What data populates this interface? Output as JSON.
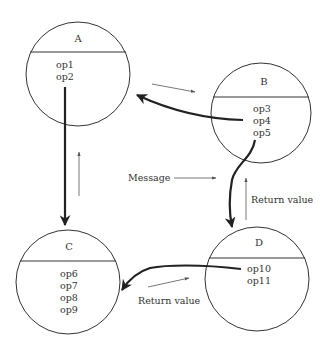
{
  "diagram": {
    "type": "object-message-diagram",
    "colors": {
      "outline": "#333333",
      "thick_arrow": "#222222",
      "thin_arrow": "#555555",
      "background": "#ffffff"
    },
    "objects": [
      {
        "id": "A",
        "name": "A",
        "operations": [
          "op1",
          "op2"
        ]
      },
      {
        "id": "B",
        "name": "B",
        "operations": [
          "op3",
          "op4",
          "op5"
        ]
      },
      {
        "id": "C",
        "name": "C",
        "operations": [
          "op6",
          "op7",
          "op8",
          "op9"
        ]
      },
      {
        "id": "D",
        "name": "D",
        "operations": [
          "op10",
          "op11"
        ]
      }
    ],
    "edges": [
      {
        "from": "A.op2",
        "to": "C",
        "kind": "call"
      },
      {
        "from": "C",
        "to": "A",
        "kind": "return"
      },
      {
        "from": "B.op4",
        "to": "A",
        "kind": "call"
      },
      {
        "from": "A",
        "to": "B",
        "kind": "return"
      },
      {
        "from": "B.op5",
        "to": "D",
        "kind": "call"
      },
      {
        "from": "D",
        "to": "B",
        "kind": "return",
        "label": "Return value"
      },
      {
        "from": "D.op10",
        "to": "C",
        "kind": "call"
      },
      {
        "from": "C",
        "to": "D",
        "kind": "return",
        "label": "Return value"
      }
    ],
    "labels": {
      "message": "Message",
      "return_value_right": "Return value",
      "return_value_bottom": "Return value"
    }
  }
}
